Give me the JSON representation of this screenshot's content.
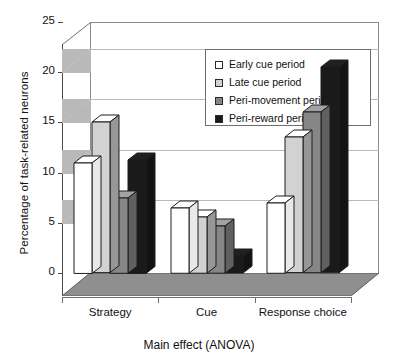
{
  "chart_data": {
    "type": "bar",
    "title": "",
    "xlabel": "Main effect (ANOVA)",
    "ylabel": "Percentage of task-related neurons",
    "categories": [
      "Strategy",
      "Cue",
      "Response choice"
    ],
    "series": [
      {
        "name": "Early cue period",
        "color": "#ffffff",
        "values": [
          11.0,
          6.5,
          7.0
        ]
      },
      {
        "name": "Late cue period",
        "color": "#d2d2d2",
        "values": [
          15.0,
          5.6,
          13.5
        ]
      },
      {
        "name": "Peri-movement period",
        "color": "#868686",
        "values": [
          7.5,
          4.7,
          16.0
        ]
      },
      {
        "name": "Peri-reward period",
        "color": "#1a1a1a",
        "values": [
          11.3,
          1.7,
          20.5
        ]
      }
    ],
    "ylim": [
      0,
      25
    ],
    "yticks": [
      0,
      5,
      10,
      15,
      20,
      25
    ],
    "ytick_labels": [
      "0",
      "5",
      "10",
      "15",
      "20",
      "25"
    ],
    "grid": true,
    "legend_position": "top-center",
    "style": "3d-perspective"
  },
  "axis": {
    "y_title": "Percentage of task-related neurons",
    "x_title": "Main effect (ANOVA)"
  },
  "legend": {
    "items": [
      {
        "label": "Early cue period",
        "swatch": "#ffffff"
      },
      {
        "label": "Late cue period",
        "swatch": "#d2d2d2"
      },
      {
        "label": "Peri-movement period",
        "swatch": "#868686"
      },
      {
        "label": "Peri-reward period",
        "swatch": "#1a1a1a"
      }
    ]
  }
}
